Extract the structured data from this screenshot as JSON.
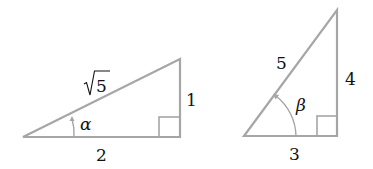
{
  "colors": {
    "stroke": "#a6a6a6",
    "text": "#111111",
    "background": "#ffffff"
  },
  "triangles": [
    {
      "name": "triangle-alpha",
      "hypotenuse_label": "5",
      "hypotenuse_radical": true,
      "opposite_label": "1",
      "adjacent_label": "2",
      "angle_label": "α",
      "right_angle": true
    },
    {
      "name": "triangle-beta",
      "hypotenuse_label": "5",
      "hypotenuse_radical": false,
      "opposite_label": "4",
      "adjacent_label": "3",
      "angle_label": "β",
      "right_angle": true
    }
  ]
}
